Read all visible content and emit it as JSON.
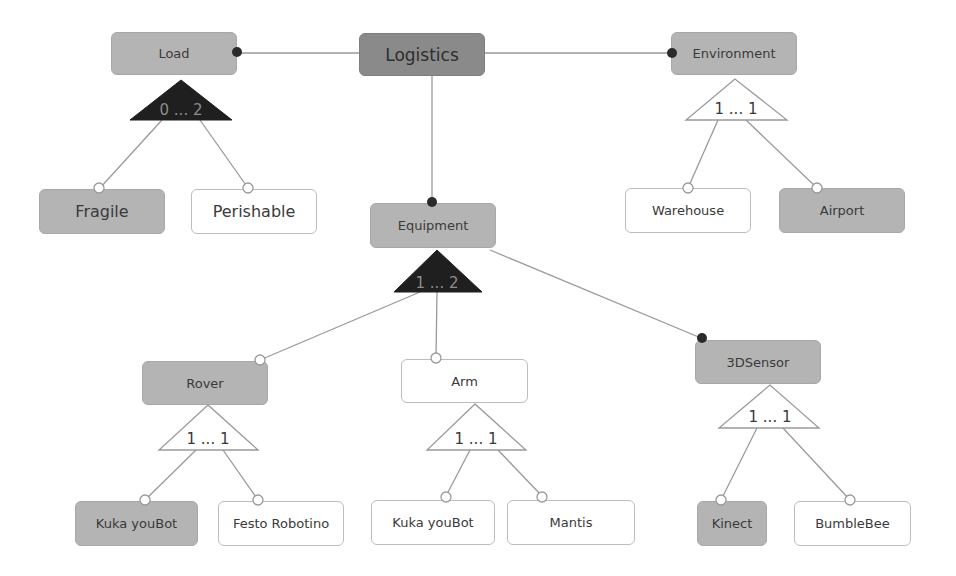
{
  "diagram": {
    "type": "feature-model",
    "colors": {
      "root_fill": "#8a8a8a",
      "selected_fill": "#b4b4b4",
      "unselected_fill": "#ffffff",
      "edge": "#9a9a9a",
      "mandatory_dot": "#2a2a2a",
      "group_dark_fill": "#1f1f1f",
      "group_dark_text": "#8c8c8c"
    },
    "nodes": {
      "logistics": "Logistics",
      "load": "Load",
      "environment": "Environment",
      "fragile": "Fragile",
      "perishable": "Perishable",
      "equipment": "Equipment",
      "warehouse": "Warehouse",
      "airport": "Airport",
      "rover": "Rover",
      "arm": "Arm",
      "sensor3d": "3DSensor",
      "rover_kuka": "Kuka youBot",
      "rover_festo": "Festo Robotino",
      "arm_kuka": "Kuka youBot",
      "arm_mantis": "Mantis",
      "kinect": "Kinect",
      "bumblebee": "BumbleBee"
    },
    "groups": {
      "load": "0 ... 2",
      "environment": "1 ... 1",
      "equipment": "1 ... 2",
      "rover": "1 ... 1",
      "arm": "1 ... 1",
      "sensor3d": "1 ... 1"
    }
  }
}
